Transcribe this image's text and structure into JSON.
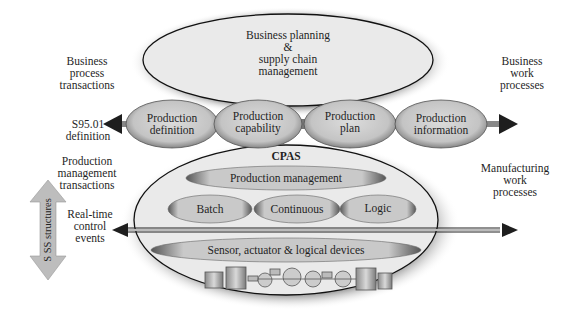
{
  "diagram": {
    "top_ellipse": {
      "lines": [
        "Business planning",
        "&",
        "supply chain",
        "management"
      ]
    },
    "pills": [
      {
        "lines": [
          "Production",
          "definition"
        ]
      },
      {
        "lines": [
          "Production",
          "capability"
        ]
      },
      {
        "lines": [
          "Production",
          "plan"
        ]
      },
      {
        "lines": [
          "Production",
          "information"
        ]
      }
    ],
    "bottom_ellipse": {
      "title": "CPAS",
      "production_management": "Production management",
      "control_types": [
        "Batch",
        "Continuous",
        "Logic"
      ],
      "devices": "Sensor, actuator & logical devices",
      "equipment_icon": "process-plant-tanks-icon"
    },
    "left_labels": {
      "business_process": [
        "Business",
        "process",
        "transactions"
      ],
      "s95_definition": [
        "S95.01",
        "definition"
      ],
      "production_management": [
        "Production",
        "management",
        "transactions"
      ],
      "real_time": [
        "Real-time",
        "control",
        "events"
      ],
      "structures_arrow": "S SS structures"
    },
    "right_labels": {
      "business_work": [
        "Business",
        "work",
        "processes"
      ],
      "manufacturing_work": [
        "Manufacturing",
        "work",
        "processes"
      ]
    },
    "colors": {
      "ellipse_fill": "#e8e8e8",
      "ellipse_outline": "#111111",
      "pill_fill": "#cfcfcf",
      "arrow_gray": "#bdbdbd",
      "arrow_dark": "#222222"
    }
  }
}
